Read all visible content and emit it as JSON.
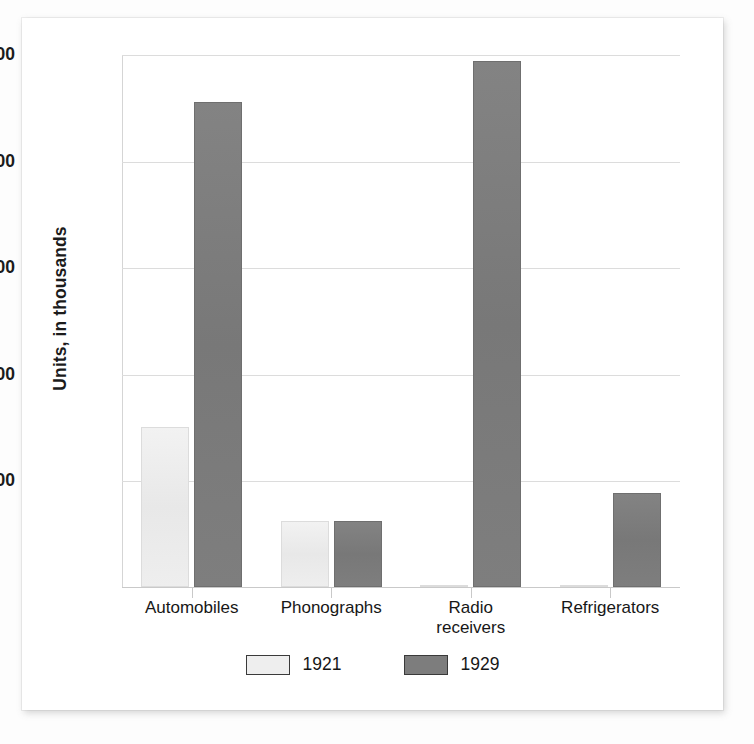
{
  "chart_data": {
    "type": "bar",
    "title": "",
    "xlabel": "",
    "ylabel": "Units, in thousands",
    "ylim": [
      0,
      5000
    ],
    "grid": true,
    "legend_position": "bottom",
    "categories": [
      "Automobiles",
      "Phonographs",
      "Radio receivers",
      "Refrigerators"
    ],
    "category_lines": [
      [
        "Automobiles"
      ],
      [
        "Phonographs"
      ],
      [
        "Radio",
        "receivers"
      ],
      [
        "Refrigerators"
      ]
    ],
    "ytick_labels": [
      "1,000",
      "2,000",
      "3,000",
      "4,000",
      "5,000"
    ],
    "ytick_values": [
      1000,
      2000,
      3000,
      4000,
      5000
    ],
    "series": [
      {
        "name": "1921",
        "color": "#eaeaea",
        "values": [
          1500,
          620,
          5,
          5
        ]
      },
      {
        "name": "1929",
        "color": "#7d7d7d",
        "values": [
          4550,
          620,
          4930,
          880
        ]
      }
    ]
  },
  "legend": {
    "items": [
      {
        "label": "1921",
        "swatch": "light-gray-swatch"
      },
      {
        "label": "1929",
        "swatch": "dark-gray-swatch"
      }
    ]
  }
}
